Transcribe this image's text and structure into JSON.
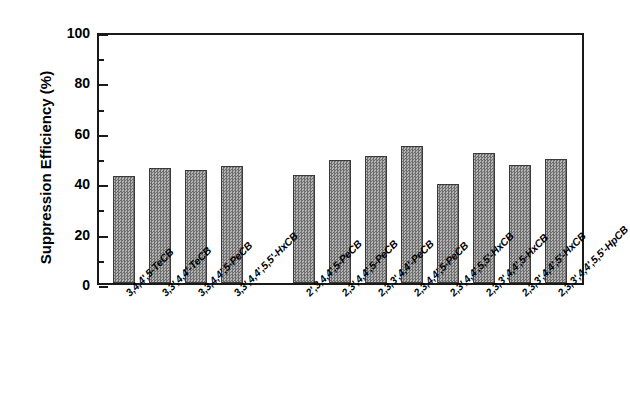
{
  "chart_data": {
    "type": "bar",
    "title": "",
    "xlabel": "",
    "ylabel": "Suppression Efficiency (%)",
    "ylim": [
      0,
      100
    ],
    "ytick_values": [
      0,
      20,
      40,
      60,
      80,
      100
    ],
    "ytick_labels": [
      "0",
      "20",
      "40",
      "60",
      "80",
      "100"
    ],
    "yminor_values": [
      10,
      30,
      50,
      70,
      90
    ],
    "grid": false,
    "legend": null,
    "bar_fill": "#8a8a8a",
    "bar_edge": "#3a3a3a",
    "axis_color": "#1a1a1a",
    "gap_after_index": 3,
    "categories": [
      "3,4,4',5-TeCB",
      "3,3',4,4'-TeCB",
      "3,3,4,4',5-PeCB",
      "3,3',4,4',5,5'-HxCB",
      "2',3,4,4',5-PeCB",
      "2,3',4,4',5-PeCB",
      "2,3,3',4,4'-PeCB",
      "2,3,4,4',5-PeCB",
      "2,3',4,4',5,5'-HxCB",
      "2,3,3',4,4',5-HxCB",
      "2,3,3',4,4',5'-HxCB",
      "2,3,3',4,4',5,5'-HpCB"
    ],
    "values": [
      42.5,
      45.5,
      45.0,
      46.5,
      42.8,
      48.7,
      50.3,
      54.2,
      39.3,
      51.5,
      46.7,
      49.2
    ]
  }
}
